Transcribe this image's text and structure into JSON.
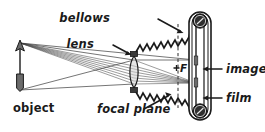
{
  "diagram": {
    "background_color": "#ffffff",
    "ink_color": "#1a1a1a",
    "ray_color": "#4a4a4a",
    "labels": {
      "bellows": "bellows",
      "lens": "lens",
      "focal_plane": "focal plane",
      "object": "object",
      "image": "image",
      "film": "film",
      "focal_point": "F"
    },
    "icons": {
      "object_arrow": "up-arrow-icon",
      "lens_element": "biconvex-lens-icon",
      "focal_point_marker": "cross-marker-icon",
      "film_spool_top": "film-spool-icon",
      "film_spool_bottom": "film-spool-icon"
    },
    "parts": [
      {
        "name": "object",
        "label": "object",
        "italic": false
      },
      {
        "name": "lens",
        "label": "lens",
        "italic": true
      },
      {
        "name": "bellows",
        "label": "bellows",
        "italic": true
      },
      {
        "name": "focal-plane",
        "label": "focal plane",
        "italic": true
      },
      {
        "name": "image",
        "label": "image",
        "italic": true
      },
      {
        "name": "film",
        "label": "film",
        "italic": true
      },
      {
        "name": "focal-point",
        "label": "F",
        "italic": true
      }
    ]
  }
}
